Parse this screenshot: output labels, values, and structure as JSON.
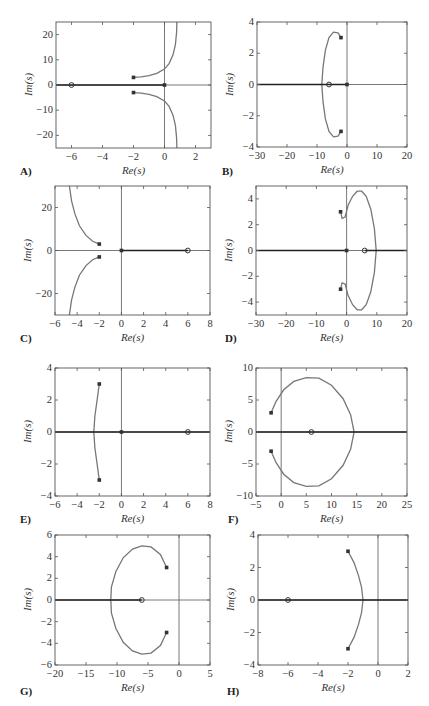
{
  "panels": [
    {
      "label": "A)",
      "xlabel": "Re(s)",
      "ylabel": "Im(s)"
    },
    {
      "label": "B)",
      "xlabel": "Re(s)",
      "ylabel": "Im(s)"
    },
    {
      "label": "C)",
      "xlabel": "Re(s)",
      "ylabel": "Im(s)"
    },
    {
      "label": "D)",
      "xlabel": "Re(s)",
      "ylabel": "Im(s)"
    },
    {
      "label": "E)",
      "xlabel": "Re(s)",
      "ylabel": "Im(s)"
    },
    {
      "label": "F)",
      "xlabel": "Re(s)",
      "ylabel": "Im(s)"
    },
    {
      "label": "G)",
      "xlabel": "Re(s)",
      "ylabel": "Im(s)"
    },
    {
      "label": "H)",
      "xlabel": "Re(s)",
      "ylabel": "Im(s)"
    }
  ],
  "chart_data": [
    {
      "id": "A",
      "type": "line",
      "title": "",
      "xlabel": "Re(s)",
      "ylabel": "Im(s)",
      "xlim": [
        -7,
        3
      ],
      "ylim": [
        -25,
        25
      ],
      "xticks": [
        -6,
        -4,
        -2,
        0,
        2
      ],
      "yticks": [
        -20,
        -10,
        0,
        10,
        20
      ],
      "grid": false,
      "legend": null,
      "poles": [
        [
          -2,
          3
        ],
        [
          -2,
          -3
        ],
        [
          0,
          0
        ]
      ],
      "zeros": [
        [
          -6,
          0
        ]
      ],
      "series": [
        {
          "name": "upper branch",
          "x": [
            -2,
            -1.5,
            -1,
            -0.5,
            0,
            0.3,
            0.55,
            0.7,
            0.78,
            0.8
          ],
          "y": [
            3,
            3.2,
            3.7,
            4.6,
            6.3,
            8.5,
            12,
            16,
            21,
            25
          ]
        },
        {
          "name": "lower branch",
          "x": [
            -2,
            -1.5,
            -1,
            -0.5,
            0,
            0.3,
            0.55,
            0.7,
            0.78,
            0.8
          ],
          "y": [
            -3,
            -3.2,
            -3.7,
            -4.6,
            -6.3,
            -8.5,
            -12,
            -16,
            -21,
            -25
          ]
        },
        {
          "name": "real axis branch",
          "x": [
            -7,
            0
          ],
          "y": [
            0,
            0
          ]
        }
      ]
    },
    {
      "id": "B",
      "type": "line",
      "title": "",
      "xlabel": "Re(s)",
      "ylabel": "Im(s)",
      "xlim": [
        -30,
        20
      ],
      "ylim": [
        -4,
        4
      ],
      "xticks": [
        -30,
        -20,
        -10,
        0,
        10,
        20
      ],
      "yticks": [
        -4,
        -2,
        0,
        2,
        4
      ],
      "grid": false,
      "legend": null,
      "poles": [
        [
          -2,
          3
        ],
        [
          -2,
          -3
        ],
        [
          0,
          0
        ]
      ],
      "zeros": [
        [
          -6,
          0
        ]
      ],
      "series": [
        {
          "name": "upper branch",
          "x": [
            -2,
            -3,
            -4.5,
            -6,
            -7.2,
            -8,
            -8.4
          ],
          "y": [
            3,
            3.3,
            3.35,
            3,
            2.2,
            1.1,
            0
          ]
        },
        {
          "name": "lower branch",
          "x": [
            -2,
            -3,
            -4.5,
            -6,
            -7.2,
            -8,
            -8.4
          ],
          "y": [
            -3,
            -3.3,
            -3.35,
            -3,
            -2.2,
            -1.1,
            0
          ]
        },
        {
          "name": "real axis branch",
          "x": [
            -30,
            0
          ],
          "y": [
            0,
            0
          ]
        }
      ]
    },
    {
      "id": "C",
      "type": "line",
      "title": "",
      "xlabel": "Re(s)",
      "ylabel": "Im(s)",
      "xlim": [
        -6,
        8
      ],
      "ylim": [
        -30,
        30
      ],
      "xticks": [
        -6,
        -4,
        -2,
        0,
        2,
        4,
        6,
        8
      ],
      "yticks": [
        -20,
        0,
        20
      ],
      "grid": false,
      "legend": null,
      "poles": [
        [
          -2,
          3
        ],
        [
          -2,
          -3
        ],
        [
          0,
          0
        ]
      ],
      "zeros": [
        [
          6,
          0
        ]
      ],
      "series": [
        {
          "name": "upper branch",
          "x": [
            -2,
            -2.6,
            -3.2,
            -3.8,
            -4.2,
            -4.5,
            -4.7
          ],
          "y": [
            3,
            4.3,
            7,
            11.5,
            17,
            23,
            30
          ]
        },
        {
          "name": "lower branch",
          "x": [
            -2,
            -2.6,
            -3.2,
            -3.8,
            -4.2,
            -4.5,
            -4.7
          ],
          "y": [
            -3,
            -4.3,
            -7,
            -11.5,
            -17,
            -23,
            -30
          ]
        },
        {
          "name": "real axis branch",
          "x": [
            0,
            6
          ],
          "y": [
            0,
            0
          ]
        }
      ]
    },
    {
      "id": "D",
      "type": "line",
      "title": "",
      "xlabel": "Re(s)",
      "ylabel": "Im(s)",
      "xlim": [
        -30,
        20
      ],
      "ylim": [
        -5,
        5
      ],
      "xticks": [
        -30,
        -20,
        -10,
        0,
        10,
        20
      ],
      "yticks": [
        -4,
        -2,
        0,
        2,
        4
      ],
      "grid": false,
      "legend": null,
      "poles": [
        [
          -2,
          3
        ],
        [
          -2,
          -3
        ],
        [
          0,
          0
        ]
      ],
      "zeros": [
        [
          6,
          0
        ]
      ],
      "series": [
        {
          "name": "upper branch",
          "x": [
            -2,
            -1.5,
            -0.5,
            0.5,
            2,
            3.5,
            5,
            6.5,
            8,
            9.2,
            9.8
          ],
          "y": [
            3,
            2.5,
            2.6,
            3.5,
            4.2,
            4.6,
            4.6,
            4.2,
            3.2,
            1.7,
            0
          ]
        },
        {
          "name": "lower branch",
          "x": [
            -2,
            -1.5,
            -0.5,
            0.5,
            2,
            3.5,
            5,
            6.5,
            8,
            9.2,
            9.8
          ],
          "y": [
            -3,
            -2.5,
            -2.6,
            -3.5,
            -4.2,
            -4.6,
            -4.6,
            -4.2,
            -3.2,
            -1.7,
            0
          ]
        },
        {
          "name": "real axis branch",
          "x": [
            -30,
            0
          ],
          "y": [
            0,
            0
          ]
        },
        {
          "name": "real axis branch 2",
          "x": [
            6,
            20
          ],
          "y": [
            0,
            0
          ]
        }
      ]
    },
    {
      "id": "E",
      "type": "line",
      "title": "",
      "xlabel": "Re(s)",
      "ylabel": "Im(s)",
      "xlim": [
        -6,
        8
      ],
      "ylim": [
        -4,
        4
      ],
      "xticks": [
        -6,
        -4,
        -2,
        0,
        2,
        4,
        6,
        8
      ],
      "yticks": [
        -4,
        -2,
        0,
        2,
        4
      ],
      "grid": false,
      "legend": null,
      "poles": [
        [
          -2,
          3
        ],
        [
          -2,
          -3
        ],
        [
          0,
          0
        ]
      ],
      "zeros": [
        [
          6,
          0
        ]
      ],
      "series": [
        {
          "name": "upper branch",
          "x": [
            -2,
            -2.2,
            -2.4,
            -2.5
          ],
          "y": [
            3,
            2,
            1,
            0
          ]
        },
        {
          "name": "lower branch",
          "x": [
            -2,
            -2.2,
            -2.4,
            -2.5
          ],
          "y": [
            -3,
            -2,
            -1,
            0
          ]
        },
        {
          "name": "real axis branch",
          "x": [
            -6,
            8
          ],
          "y": [
            0,
            0
          ]
        }
      ]
    },
    {
      "id": "F",
      "type": "line",
      "title": "",
      "xlabel": "Re(s)",
      "ylabel": "Im(s)",
      "xlim": [
        -5,
        25
      ],
      "ylim": [
        -10,
        10
      ],
      "xticks": [
        -5,
        0,
        5,
        10,
        15,
        20,
        25
      ],
      "yticks": [
        -10,
        -5,
        0,
        5,
        10
      ],
      "grid": false,
      "legend": null,
      "poles": [
        [
          -2,
          3
        ],
        [
          -2,
          -3
        ]
      ],
      "zeros": [
        [
          6,
          0
        ]
      ],
      "series": [
        {
          "name": "upper branch",
          "x": [
            -2,
            -1,
            0.5,
            2.5,
            5,
            7.5,
            10,
            12.3,
            13.8,
            14.5
          ],
          "y": [
            3,
            4.8,
            6.6,
            7.9,
            8.5,
            8.4,
            7.3,
            5.2,
            2.7,
            0
          ]
        },
        {
          "name": "lower branch",
          "x": [
            -2,
            -1,
            0.5,
            2.5,
            5,
            7.5,
            10,
            12.3,
            13.8,
            14.5
          ],
          "y": [
            -3,
            -4.8,
            -6.6,
            -7.9,
            -8.5,
            -8.4,
            -7.3,
            -5.2,
            -2.7,
            0
          ]
        },
        {
          "name": "real axis branch",
          "x": [
            -5,
            25
          ],
          "y": [
            0,
            0
          ]
        }
      ]
    },
    {
      "id": "G",
      "type": "line",
      "title": "",
      "xlabel": "Re(s)",
      "ylabel": "Im(s)",
      "xlim": [
        -20,
        5
      ],
      "ylim": [
        -6,
        6
      ],
      "xticks": [
        -20,
        -15,
        -10,
        -5,
        0,
        5
      ],
      "yticks": [
        -6,
        -4,
        -2,
        0,
        2,
        4,
        6
      ],
      "grid": false,
      "legend": null,
      "poles": [
        [
          -2,
          3
        ],
        [
          -2,
          -3
        ]
      ],
      "zeros": [
        [
          -6,
          0
        ]
      ],
      "series": [
        {
          "name": "upper branch",
          "x": [
            -2,
            -3,
            -4.5,
            -6,
            -7.5,
            -9,
            -10.2,
            -10.9,
            -11
          ],
          "y": [
            3,
            4.2,
            4.9,
            5,
            4.7,
            3.9,
            2.6,
            1.2,
            0
          ]
        },
        {
          "name": "lower branch",
          "x": [
            -2,
            -3,
            -4.5,
            -6,
            -7.5,
            -9,
            -10.2,
            -10.9,
            -11
          ],
          "y": [
            -3,
            -4.2,
            -4.9,
            -5,
            -4.7,
            -3.9,
            -2.6,
            -1.2,
            0
          ]
        },
        {
          "name": "real axis branch",
          "x": [
            -20,
            -6
          ],
          "y": [
            0,
            0
          ]
        }
      ]
    },
    {
      "id": "H",
      "type": "line",
      "title": "",
      "xlabel": "Re(s)",
      "ylabel": "Im(s)",
      "xlim": [
        -8,
        2
      ],
      "ylim": [
        -4,
        4
      ],
      "xticks": [
        -8,
        -6,
        -4,
        -2,
        0,
        2
      ],
      "yticks": [
        -4,
        -2,
        0,
        2,
        4
      ],
      "grid": false,
      "legend": null,
      "poles": [
        [
          -2,
          3
        ],
        [
          -2,
          -3
        ]
      ],
      "zeros": [
        [
          -6,
          0
        ]
      ],
      "series": [
        {
          "name": "upper branch",
          "x": [
            -2,
            -1.6,
            -1.3,
            -1.1,
            -1.0
          ],
          "y": [
            3,
            2.3,
            1.5,
            0.8,
            0
          ]
        },
        {
          "name": "lower branch",
          "x": [
            -2,
            -1.6,
            -1.3,
            -1.1,
            -1.0
          ],
          "y": [
            -3,
            -2.3,
            -1.5,
            -0.8,
            0
          ]
        },
        {
          "name": "real axis branch",
          "x": [
            -8,
            2
          ],
          "y": [
            0,
            0
          ]
        }
      ]
    }
  ]
}
